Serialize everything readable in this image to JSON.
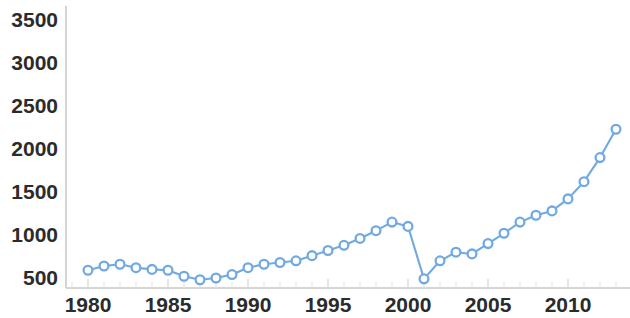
{
  "chart_data": {
    "type": "line",
    "title": "",
    "subtitle": "",
    "xlabel": "",
    "ylabel": "",
    "xlim": [
      1979,
      2013.5
    ],
    "ylim": [
      430,
      3680
    ],
    "grid": false,
    "legend": null,
    "x_ticks_major": [
      1980,
      1985,
      1990,
      1995,
      2000,
      2005,
      2010
    ],
    "x_tick_labels": [
      "1980",
      "1985",
      "1990",
      "1995",
      "2000",
      "2005",
      "2010"
    ],
    "y_ticks": [
      500,
      1000,
      1500,
      2000,
      2500,
      3000,
      3500
    ],
    "y_tick_labels": [
      "500",
      "1000",
      "1500",
      "2000",
      "2500",
      "3000",
      "3500"
    ],
    "x": [
      1980,
      1981,
      1982,
      1983,
      1984,
      1985,
      1986,
      1987,
      1988,
      1989,
      1990,
      1991,
      1992,
      1993,
      1994,
      1995,
      1996,
      1997,
      1998,
      1999,
      2000,
      2001,
      2002,
      2003,
      2004,
      2005,
      2006,
      2007,
      2008,
      2009,
      2010,
      2011,
      2012,
      2013
    ],
    "values": [
      590,
      640,
      660,
      620,
      600,
      590,
      520,
      480,
      500,
      540,
      620,
      660,
      680,
      700,
      760,
      820,
      880,
      960,
      1050,
      1150,
      1100,
      490,
      700,
      800,
      780,
      900,
      1020,
      1150,
      1230,
      1280,
      1300,
      1420,
      1620,
      1900
    ],
    "series": [
      {
        "name": "series-1",
        "color": "#72a9e0",
        "marker": "circle-open",
        "x": [
          1980,
          1981,
          1982,
          1983,
          1984,
          1985,
          1986,
          1987,
          1988,
          1989,
          1990,
          1991,
          1992,
          1993,
          1994,
          1995,
          1996,
          1997,
          1998,
          1999,
          2000,
          2001,
          2002,
          2003,
          2004,
          2005,
          2006,
          2007,
          2008,
          2009,
          2010,
          2011,
          2012,
          2013
        ],
        "values": [
          590,
          640,
          660,
          620,
          600,
          590,
          520,
          480,
          500,
          540,
          620,
          660,
          680,
          700,
          760,
          820,
          880,
          960,
          1050,
          1150,
          1100,
          490,
          700,
          800,
          780,
          900,
          1020,
          1150,
          1230,
          1280,
          1420,
          1620,
          1900,
          2230
        ]
      }
    ]
  },
  "style": {
    "line_color": "#72a9e0",
    "marker_fill": "#ffffff",
    "marker_stroke": "#72a9e0",
    "axis_color": "#c9c9c9",
    "tick_color": "#d6d6d6",
    "label_color": "#2b2b2b",
    "background": "#ffffff"
  }
}
